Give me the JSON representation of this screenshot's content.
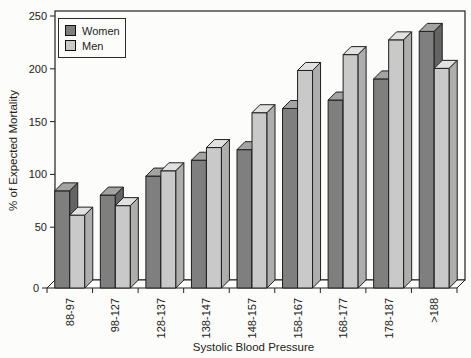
{
  "figure": {
    "background": "#fcfcfa",
    "outline_color": "#1f1f1f",
    "text_color": "#222222"
  },
  "chart_data": {
    "type": "bar",
    "style": "3d-bars",
    "title": "",
    "xlabel": "Systolic Blood Pressure",
    "ylabel": "% of Expected Mortality",
    "categories": [
      "88-97",
      "98-127",
      "128-137",
      "138-147",
      "148-157",
      "158-167",
      "168-177",
      "178-187",
      ">188"
    ],
    "series": [
      {
        "name": "Women",
        "color": "#7f7f7f",
        "color_top": "#a3a3a3",
        "color_side": "#646464",
        "values": [
          92,
          88,
          106,
          121,
          131,
          170,
          178,
          198,
          243
        ]
      },
      {
        "name": "Men",
        "color": "#c9c9c9",
        "color_top": "#e1e1e1",
        "color_side": "#aeaeae",
        "values": [
          69,
          78,
          111,
          133,
          166,
          206,
          221,
          235,
          208
        ]
      }
    ],
    "ylim": [
      0,
      250
    ],
    "yticks": [
      0,
      50,
      100,
      150,
      200,
      250
    ],
    "grid": false,
    "legend_position": "top-left"
  }
}
